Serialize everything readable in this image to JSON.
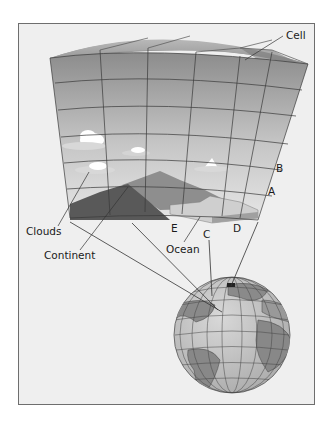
{
  "figure": {
    "labels": {
      "cell": "Cell",
      "b": "B",
      "a": "A",
      "clouds": "Clouds",
      "continent": "Continent",
      "e": "E",
      "c": "C",
      "d": "D",
      "ocean": "Ocean"
    },
    "colors": {
      "frame_bg": "#efefef",
      "frame_border": "#6e6e6e",
      "grid_top": "#8f8f8f",
      "grid_bottom": "#e2e2e2",
      "grid_line": "#3a3a3a",
      "continent_dark": "#5a5a5a",
      "mountain": "#7d7d7d",
      "ocean_slab": "#c9c9c9",
      "globe_ocean": "#c4c4c4",
      "globe_land": "#8a8a8a"
    },
    "grid": {
      "columns": 6,
      "rows": 6
    }
  }
}
